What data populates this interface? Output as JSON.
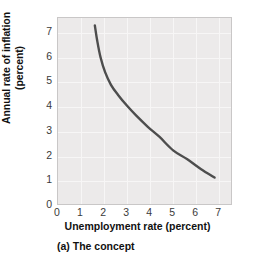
{
  "chart_data": {
    "type": "line",
    "title": "",
    "subtitle": "",
    "caption": "(a) The concept",
    "xlabel": "Unemployment rate (percent)",
    "ylabel_line1": "Annual rate of inflation",
    "ylabel_line2": "(percent)",
    "ylabel": "Annual rate of inflation (percent)",
    "xlim": [
      0,
      7.6
    ],
    "ylim": [
      0,
      7.6
    ],
    "xticks": [
      0,
      1,
      2,
      3,
      4,
      5,
      6,
      7
    ],
    "yticks": [
      0,
      1,
      2,
      3,
      4,
      5,
      6,
      7
    ],
    "xtick_labels": [
      "0",
      "1",
      "2",
      "3",
      "4",
      "5",
      "6",
      "7"
    ],
    "ytick_labels": [
      "0",
      "1",
      "2",
      "3",
      "4",
      "5",
      "6",
      "7"
    ],
    "grid": true,
    "legend": false,
    "legend_position": "none",
    "series": [
      {
        "name": "Phillips curve",
        "color": "#4d4d4d",
        "line_width": 2.4,
        "x": [
          1.6,
          1.7,
          1.85,
          2.05,
          2.3,
          2.6,
          3.0,
          3.4,
          3.9,
          4.4,
          5.0,
          5.6,
          6.2,
          6.8
        ],
        "y": [
          7.3,
          6.7,
          6.0,
          5.4,
          4.9,
          4.5,
          4.05,
          3.65,
          3.2,
          2.8,
          2.25,
          1.9,
          1.5,
          1.15
        ]
      }
    ],
    "colors": {
      "plot_background": "#eceaea",
      "grid_line": "#f7f6f6",
      "plot_border": "#c9c7c7",
      "curve": "#4d4d4d",
      "tick_text": "#3a3a3a",
      "axis_title_text": "#111111",
      "page_background": "#ffffff"
    }
  }
}
